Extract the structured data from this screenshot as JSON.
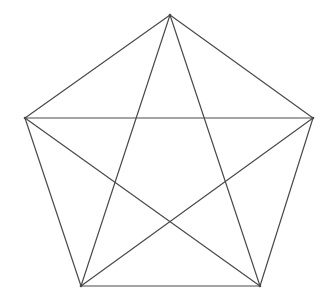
{
  "diagram": {
    "title": "",
    "stroke_color": "#4a4a4a",
    "stroke_width": 1.2,
    "background": "#ffffff",
    "vertices": [
      {
        "id": "top",
        "x": 170,
        "y": 15
      },
      {
        "id": "right",
        "x": 313,
        "y": 118
      },
      {
        "id": "bottom-right",
        "x": 260,
        "y": 286
      },
      {
        "id": "bottom-left",
        "x": 81,
        "y": 286
      },
      {
        "id": "left",
        "x": 25,
        "y": 118
      }
    ],
    "edges": [
      {
        "type": "side",
        "from": 0,
        "to": 1
      },
      {
        "type": "side",
        "from": 1,
        "to": 2
      },
      {
        "type": "side",
        "from": 2,
        "to": 3
      },
      {
        "type": "side",
        "from": 3,
        "to": 4
      },
      {
        "type": "side",
        "from": 4,
        "to": 0
      },
      {
        "type": "diagonal",
        "from": 0,
        "to": 2
      },
      {
        "type": "diagonal",
        "from": 0,
        "to": 3
      },
      {
        "type": "diagonal",
        "from": 1,
        "to": 3
      },
      {
        "type": "diagonal",
        "from": 1,
        "to": 4
      },
      {
        "type": "diagonal",
        "from": 2,
        "to": 4
      }
    ]
  }
}
